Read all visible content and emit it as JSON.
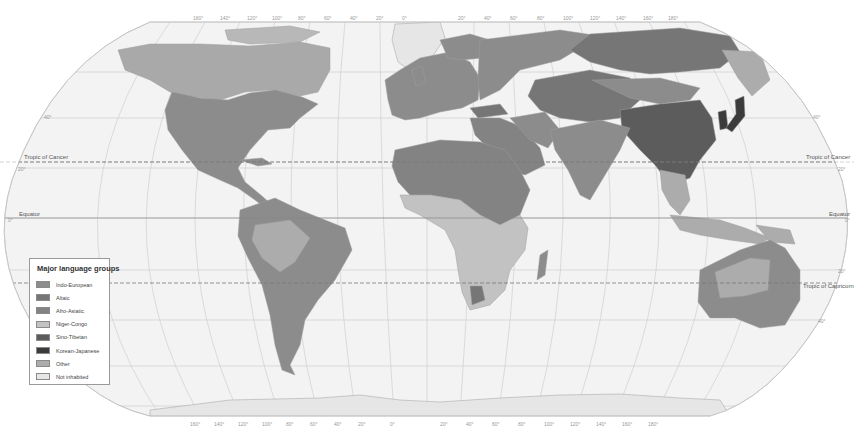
{
  "map": {
    "projection": "Robinson-style world map",
    "colors": {
      "ocean": "#f3f3f3",
      "graticule": "#bdbdbd",
      "border": "#9e9e9e"
    },
    "reference_lines": {
      "tropic_of_cancer": "Tropic of Cancer",
      "equator": "Equator",
      "tropic_of_capricorn": "Tropic of Capricorn"
    },
    "latitude_ticks": {
      "n40": "40°",
      "n20": "20°",
      "zero": "0°",
      "s20": "20°",
      "s40": "40°"
    },
    "longitude_ticks_top": [
      "160°",
      "140°",
      "120°",
      "100°",
      "80°",
      "60°",
      "40°",
      "20°",
      "0°",
      "20°",
      "40°",
      "60°",
      "80°",
      "100°",
      "120°",
      "140°",
      "160°",
      "180°"
    ],
    "longitude_ticks_bottom": [
      "160°",
      "140°",
      "120°",
      "100°",
      "80°",
      "60°",
      "40°",
      "20°",
      "0°",
      "20°",
      "40°",
      "60°",
      "80°",
      "100°",
      "120°",
      "140°",
      "160°",
      "180°"
    ]
  },
  "legend": {
    "title": "Major language groups",
    "items": [
      {
        "label": "Indo-European",
        "color": "#8c8c8c"
      },
      {
        "label": "Altaic",
        "color": "#767676"
      },
      {
        "label": "Afro-Asiatic",
        "color": "#838383"
      },
      {
        "label": "Niger-Congo",
        "color": "#c2c2c2"
      },
      {
        "label": "Sino-Tibetan",
        "color": "#5c5c5c"
      },
      {
        "label": "Korean-Japanese",
        "color": "#3b3b3b"
      },
      {
        "label": "Other",
        "color": "#acacac"
      },
      {
        "label": "Not inhabited",
        "color": "#e6e6e6"
      }
    ]
  }
}
